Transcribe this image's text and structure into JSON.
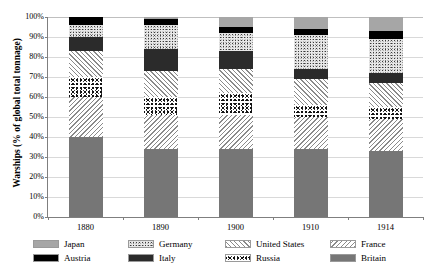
{
  "chart_data": {
    "type": "bar",
    "title": "",
    "subtitle": "",
    "xlabel": "",
    "ylabel": "Warships (% of global total tonnage)",
    "categories": [
      "1880",
      "1890",
      "1900",
      "1910",
      "1914"
    ],
    "ylim": [
      0,
      100
    ],
    "ytick_labels": [
      "0%",
      "10%",
      "20%",
      "30%",
      "40%",
      "50%",
      "60%",
      "70%",
      "80%",
      "90%",
      "100%"
    ],
    "ytick_values": [
      0,
      10,
      20,
      30,
      40,
      50,
      60,
      70,
      80,
      90,
      100
    ],
    "grid": true,
    "stacked": true,
    "legend_position": "bottom",
    "series": [
      {
        "name": "Britain",
        "values": [
          40,
          34,
          34,
          34,
          33
        ],
        "color": "#767676",
        "pattern": "solid-gray"
      },
      {
        "name": "France",
        "values": [
          20,
          17,
          17,
          16,
          16
        ],
        "color": "#8a8a8a",
        "pattern": "backslash-hatch"
      },
      {
        "name": "Russia",
        "values": [
          10,
          9,
          11,
          6,
          6
        ],
        "color": "#111111",
        "pattern": "coarse-speckle"
      },
      {
        "name": "United States",
        "values": [
          13,
          13,
          12,
          13,
          12
        ],
        "color": "#8a8a8a",
        "pattern": "forward-hatch"
      },
      {
        "name": "Italy",
        "values": [
          7,
          11,
          9,
          5,
          5
        ],
        "color": "#2b2b2b",
        "pattern": "solid-dark"
      },
      {
        "name": "Germany",
        "values": [
          6,
          12,
          9,
          17,
          17
        ],
        "color": "#e8e8e8",
        "pattern": "fine-speckle"
      },
      {
        "name": "Austria",
        "values": [
          4,
          3,
          3,
          3,
          4
        ],
        "color": "#000000",
        "pattern": "solid-black"
      },
      {
        "name": "Japan",
        "values": [
          0,
          1,
          5,
          6,
          7
        ],
        "color": "#a6a6a6",
        "pattern": "solid-lightgray"
      }
    ],
    "legend_order": [
      "Japan",
      "Germany",
      "United States",
      "France",
      "Austria",
      "Italy",
      "Russia",
      "Britain"
    ]
  },
  "legend": {
    "row1": [
      {
        "label": "Japan",
        "fill_class": "f-japan"
      },
      {
        "label": "Germany",
        "fill_class": "f-germany"
      },
      {
        "label": "United States",
        "fill_class": "f-us"
      },
      {
        "label": "France",
        "fill_class": "f-france"
      }
    ],
    "row2": [
      {
        "label": "Austria",
        "fill_class": "f-austria"
      },
      {
        "label": "Italy",
        "fill_class": "f-italy"
      },
      {
        "label": "Russia",
        "fill_class": "f-russia"
      },
      {
        "label": "Britain",
        "fill_class": "f-britain"
      }
    ]
  }
}
